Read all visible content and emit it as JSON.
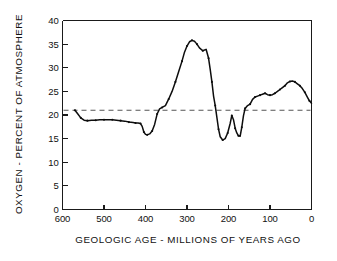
{
  "chart_data": {
    "type": "line",
    "title": "",
    "xlabel": "GEOLOGIC AGE - MILLIONS OF YEARS AGO",
    "ylabel": "OXYGEN - PERCENT OF ATMOSPHERE",
    "xlim": [
      600,
      0
    ],
    "ylim": [
      0,
      40
    ],
    "x_reversed": true,
    "grid": false,
    "legend": "none",
    "x_ticks": [
      600,
      500,
      400,
      300,
      200,
      100,
      0
    ],
    "x_tick_labels": [
      "600",
      "500",
      "400",
      "300",
      "200",
      "100",
      "0"
    ],
    "y_ticks": [
      0,
      5,
      10,
      15,
      20,
      25,
      30,
      35,
      40
    ],
    "y_tick_labels": [
      "0",
      "5",
      "10",
      "15",
      "20",
      "25",
      "30",
      "35",
      "40"
    ],
    "annotations": [
      {
        "kind": "horizontal-reference-line",
        "label": "present-day atmospheric oxygen level",
        "y": 21,
        "style": "dashed",
        "color": "#555555"
      }
    ],
    "series": [
      {
        "name": "Oxygen - percent of atmosphere",
        "color": "#0d0d0d",
        "marker": "dot",
        "x": [
          570,
          563,
          556,
          548,
          540,
          530,
          520,
          510,
          500,
          490,
          480,
          470,
          460,
          450,
          440,
          430,
          424,
          418,
          412,
          408,
          404,
          400,
          396,
          390,
          384,
          378,
          372,
          366,
          360,
          352,
          344,
          336,
          328,
          320,
          312,
          306,
          300,
          294,
          288,
          282,
          276,
          270,
          262,
          254,
          248,
          244,
          240,
          236,
          232,
          228,
          224,
          220,
          214,
          208,
          202,
          196,
          192,
          188,
          184,
          180,
          176,
          172,
          168,
          164,
          160,
          154,
          148,
          142,
          136,
          130,
          124,
          118,
          112,
          106,
          100,
          94,
          88,
          82,
          76,
          70,
          64,
          58,
          52,
          46,
          40,
          34,
          28,
          22,
          16,
          10,
          5,
          0
        ],
        "y": [
          21.0,
          20.2,
          19.4,
          18.9,
          18.8,
          18.9,
          18.9,
          19.0,
          19.0,
          19.0,
          19.0,
          18.9,
          18.8,
          18.7,
          18.5,
          18.4,
          18.3,
          18.3,
          18.2,
          17.6,
          16.4,
          15.9,
          15.8,
          16.0,
          16.6,
          18.0,
          20.2,
          21.3,
          21.6,
          22.0,
          23.4,
          25.0,
          27.0,
          29.2,
          31.4,
          33.3,
          34.6,
          35.5,
          35.8,
          35.6,
          35.0,
          34.2,
          33.6,
          33.9,
          32.0,
          29.6,
          27.0,
          24.0,
          22.0,
          19.5,
          17.0,
          15.4,
          14.7,
          15.0,
          16.2,
          18.2,
          19.9,
          19.0,
          17.2,
          16.2,
          15.6,
          15.5,
          17.4,
          19.8,
          21.4,
          22.0,
          22.3,
          23.3,
          23.8,
          24.0,
          24.2,
          24.4,
          24.6,
          24.3,
          24.2,
          24.3,
          24.6,
          25.0,
          25.4,
          25.8,
          26.2,
          26.8,
          27.1,
          27.2,
          27.0,
          26.6,
          26.2,
          25.6,
          24.8,
          23.8,
          23.0,
          22.5
        ]
      }
    ]
  },
  "axis": {
    "y_label_text": "OXYGEN - PERCENT OF ATMOSPHERE",
    "x_label_text": "GEOLOGIC AGE - MILLIONS OF YEARS AGO"
  }
}
